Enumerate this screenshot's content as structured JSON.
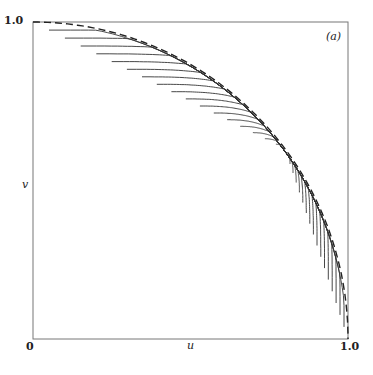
{
  "chart_data": {
    "type": "line",
    "title": "",
    "panel_label": "(a)",
    "xlabel": "u",
    "ylabel": "v",
    "xlim": [
      0,
      1
    ],
    "ylim": [
      0,
      1
    ],
    "x_ticks": [
      "0",
      "1.0"
    ],
    "y_ticks": [
      "1.0"
    ],
    "grid": false,
    "legend": null,
    "envelope": {
      "style": "dashed",
      "shape": "quarter circle u^2 + v^2 = 1"
    },
    "contours": {
      "count": 17,
      "style": "solid",
      "converge_to": [
        0.8,
        0.6
      ]
    }
  },
  "labels": {
    "y_top": "1.0",
    "origin": "0",
    "x_right": "1.0",
    "x_axis": "u",
    "y_axis": "v",
    "panel": "(a)"
  },
  "colors": {
    "line": "#333333",
    "axis": "#666666"
  }
}
